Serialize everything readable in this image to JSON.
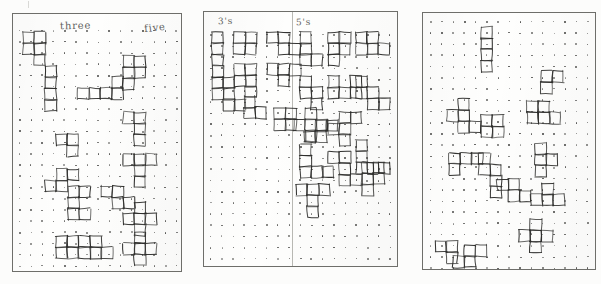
{
  "document": {
    "kind": "scanned-worksheet",
    "description": "Three sheets of dot-grid paper photographed side by side, each covered with hand-drawn polyomino shapes outlined on the dots.",
    "background_color": "#fcfcfb",
    "ink_color": "#2e2e2c",
    "dot_color": "#4a4a48",
    "border_color": "#6e6e6a"
  },
  "panels": [
    {
      "id": "panel-left",
      "name": "three-and-five-sheet",
      "labels": [
        {
          "text": "three",
          "x": 47,
          "y": 8
        },
        {
          "text": "five",
          "x": 131,
          "y": 10
        }
      ],
      "grid": {
        "cols": 15,
        "rows": 23,
        "spacing": 11.2,
        "offset_x": 6,
        "offset_y": 16
      },
      "divider_x": null,
      "shape_count": 14
    },
    {
      "id": "panel-middle",
      "name": "threes-and-fives-sheet",
      "labels": [
        {
          "text": "3's",
          "x": 14,
          "y": 5
        },
        {
          "text": "5's",
          "x": 92,
          "y": 6
        }
      ],
      "grid": {
        "cols": 17,
        "rows": 22,
        "spacing": 11.2,
        "offset_x": 6,
        "offset_y": 22
      },
      "divider_x": 88,
      "shape_count": 23
    },
    {
      "id": "panel-right",
      "name": "unlabelled-sheet",
      "labels": [],
      "grid": {
        "cols": 15,
        "rows": 23,
        "spacing": 11.2,
        "offset_x": 7,
        "offset_y": 8
      },
      "divider_x": null,
      "shape_count": 13
    }
  ],
  "shapes": {
    "panel-left": [
      {
        "name": "P-pentomino",
        "cells": [
          [
            0,
            0
          ],
          [
            1,
            0
          ],
          [
            0,
            1
          ],
          [
            1,
            1
          ],
          [
            1,
            2
          ]
        ],
        "x": 10,
        "y": 18
      },
      {
        "name": "I-tetromino",
        "cells": [
          [
            0,
            0
          ],
          [
            0,
            1
          ],
          [
            0,
            2
          ],
          [
            0,
            3
          ]
        ],
        "x": 32,
        "y": 52
      },
      {
        "name": "L-pentomino",
        "cells": [
          [
            0,
            0
          ],
          [
            1,
            0
          ],
          [
            2,
            0
          ],
          [
            3,
            0
          ],
          [
            3,
            -1
          ]
        ],
        "x": 65,
        "y": 74
      },
      {
        "name": "P-pentomino",
        "cells": [
          [
            0,
            0
          ],
          [
            1,
            0
          ],
          [
            0,
            1
          ],
          [
            1,
            1
          ],
          [
            0,
            2
          ]
        ],
        "x": 110,
        "y": 42
      },
      {
        "name": "T-tetromino",
        "cells": [
          [
            0,
            0
          ],
          [
            1,
            0
          ],
          [
            1,
            1
          ]
        ],
        "x": 43,
        "y": 120
      },
      {
        "name": "L-tetromino",
        "cells": [
          [
            0,
            0
          ],
          [
            1,
            0
          ],
          [
            1,
            1
          ],
          [
            1,
            2
          ]
        ],
        "x": 110,
        "y": 98
      },
      {
        "name": "S-pentomino",
        "cells": [
          [
            1,
            0
          ],
          [
            2,
            0
          ],
          [
            0,
            1
          ],
          [
            1,
            1
          ]
        ],
        "x": 32,
        "y": 155
      },
      {
        "name": "T-pentomino",
        "cells": [
          [
            0,
            0
          ],
          [
            1,
            0
          ],
          [
            2,
            0
          ],
          [
            1,
            1
          ],
          [
            1,
            2
          ]
        ],
        "x": 110,
        "y": 140
      },
      {
        "name": "Y-pentomino",
        "cells": [
          [
            0,
            0
          ],
          [
            1,
            0
          ],
          [
            0,
            1
          ],
          [
            0,
            2
          ],
          [
            1,
            2
          ]
        ],
        "x": 55,
        "y": 172
      },
      {
        "name": "Z-pentomino",
        "cells": [
          [
            0,
            0
          ],
          [
            1,
            0
          ],
          [
            1,
            1
          ],
          [
            2,
            1
          ]
        ],
        "x": 88,
        "y": 172
      },
      {
        "name": "X-pentomino",
        "cells": [
          [
            1,
            0
          ],
          [
            0,
            1
          ],
          [
            1,
            1
          ],
          [
            2,
            1
          ],
          [
            1,
            2
          ]
        ],
        "x": 110,
        "y": 188
      },
      {
        "name": "O-tetromino",
        "cells": [
          [
            0,
            0
          ],
          [
            1,
            0
          ],
          [
            0,
            1
          ],
          [
            1,
            1
          ]
        ],
        "x": 43,
        "y": 222
      },
      {
        "name": "P-pentomino",
        "cells": [
          [
            0,
            0
          ],
          [
            1,
            0
          ],
          [
            0,
            1
          ],
          [
            1,
            1
          ],
          [
            2,
            1
          ]
        ],
        "x": 66,
        "y": 222
      },
      {
        "name": "X-pentomino",
        "cells": [
          [
            1,
            0
          ],
          [
            0,
            1
          ],
          [
            1,
            1
          ],
          [
            2,
            1
          ],
          [
            1,
            2
          ]
        ],
        "x": 110,
        "y": 218
      }
    ],
    "panel-middle": [
      {
        "name": "I-tromino",
        "cells": [
          [
            0,
            0
          ],
          [
            0,
            1
          ],
          [
            0,
            2
          ]
        ],
        "x": 8,
        "y": 20
      },
      {
        "name": "O-square",
        "cells": [
          [
            0,
            0
          ],
          [
            1,
            0
          ],
          [
            0,
            1
          ],
          [
            1,
            1
          ]
        ],
        "x": 30,
        "y": 20
      },
      {
        "name": "S-piece",
        "cells": [
          [
            0,
            0
          ],
          [
            1,
            0
          ],
          [
            1,
            1
          ],
          [
            2,
            1
          ]
        ],
        "x": 63,
        "y": 20
      },
      {
        "name": "L-tromino",
        "cells": [
          [
            0,
            0
          ],
          [
            0,
            1
          ],
          [
            1,
            1
          ]
        ],
        "x": 8,
        "y": 54
      },
      {
        "name": "P-piece",
        "cells": [
          [
            0,
            0
          ],
          [
            1,
            0
          ],
          [
            0,
            1
          ],
          [
            1,
            1
          ],
          [
            1,
            2
          ]
        ],
        "x": 30,
        "y": 52
      },
      {
        "name": "T-piece",
        "cells": [
          [
            0,
            0
          ],
          [
            1,
            0
          ],
          [
            2,
            0
          ],
          [
            1,
            1
          ]
        ],
        "x": 63,
        "y": 52
      },
      {
        "name": "Z-piece",
        "cells": [
          [
            0,
            0
          ],
          [
            1,
            0
          ],
          [
            1,
            1
          ],
          [
            2,
            1
          ]
        ],
        "x": 8,
        "y": 76
      },
      {
        "name": "L-pentomino",
        "cells": [
          [
            0,
            0
          ],
          [
            0,
            1
          ],
          [
            0,
            2
          ],
          [
            1,
            2
          ]
        ],
        "x": 96,
        "y": 20
      },
      {
        "name": "T-pentomino",
        "cells": [
          [
            0,
            0
          ],
          [
            1,
            0
          ],
          [
            0,
            1
          ],
          [
            1,
            1
          ],
          [
            0,
            2
          ]
        ],
        "x": 124,
        "y": 20
      },
      {
        "name": "Y-pentomino",
        "cells": [
          [
            0,
            0
          ],
          [
            1,
            0
          ],
          [
            0,
            1
          ],
          [
            1,
            1
          ],
          [
            2,
            1
          ]
        ],
        "x": 152,
        "y": 20
      },
      {
        "name": "N-pentomino",
        "cells": [
          [
            0,
            0
          ],
          [
            0,
            1
          ],
          [
            1,
            1
          ],
          [
            1,
            2
          ]
        ],
        "x": 96,
        "y": 64
      },
      {
        "name": "U-pentomino",
        "cells": [
          [
            0,
            0
          ],
          [
            2,
            0
          ],
          [
            0,
            1
          ],
          [
            1,
            1
          ],
          [
            2,
            1
          ]
        ],
        "x": 124,
        "y": 64
      },
      {
        "name": "W-pentomino",
        "cells": [
          [
            0,
            0
          ],
          [
            0,
            1
          ],
          [
            1,
            1
          ],
          [
            1,
            2
          ],
          [
            2,
            2
          ]
        ],
        "x": 152,
        "y": 64
      },
      {
        "name": "X-pentomino",
        "cells": [
          [
            1,
            0
          ],
          [
            0,
            1
          ],
          [
            1,
            1
          ],
          [
            2,
            1
          ],
          [
            1,
            2
          ]
        ],
        "x": 90,
        "y": 96
      },
      {
        "name": "F-pentomino",
        "cells": [
          [
            1,
            0
          ],
          [
            2,
            0
          ],
          [
            0,
            1
          ],
          [
            1,
            1
          ],
          [
            1,
            2
          ]
        ],
        "x": 124,
        "y": 100
      },
      {
        "name": "V-pentomino",
        "cells": [
          [
            0,
            0
          ],
          [
            0,
            1
          ],
          [
            0,
            2
          ],
          [
            1,
            2
          ],
          [
            2,
            2
          ]
        ],
        "x": 96,
        "y": 132
      },
      {
        "name": "L-pentomino",
        "cells": [
          [
            0,
            0
          ],
          [
            0,
            1
          ],
          [
            0,
            2
          ],
          [
            1,
            2
          ],
          [
            2,
            2
          ]
        ],
        "x": 152,
        "y": 128
      },
      {
        "name": "Z-pentomino",
        "cells": [
          [
            0,
            0
          ],
          [
            1,
            0
          ],
          [
            1,
            1
          ],
          [
            1,
            2
          ],
          [
            2,
            2
          ]
        ],
        "x": 124,
        "y": 140
      },
      {
        "name": "T-pentomino",
        "cells": [
          [
            0,
            0
          ],
          [
            1,
            0
          ],
          [
            2,
            0
          ],
          [
            1,
            1
          ],
          [
            1,
            2
          ]
        ],
        "x": 92,
        "y": 172
      },
      {
        "name": "P-pentomino",
        "cells": [
          [
            0,
            0
          ],
          [
            1,
            0
          ],
          [
            0,
            1
          ],
          [
            1,
            1
          ],
          [
            0,
            2
          ]
        ],
        "x": 158,
        "y": 150
      },
      {
        "name": "S-pentomino",
        "cells": [
          [
            1,
            0
          ],
          [
            2,
            0
          ],
          [
            0,
            1
          ],
          [
            1,
            1
          ]
        ],
        "x": 100,
        "y": 108
      },
      {
        "name": "O-square",
        "cells": [
          [
            0,
            0
          ],
          [
            1,
            0
          ],
          [
            0,
            1
          ],
          [
            1,
            1
          ]
        ],
        "x": 70,
        "y": 96
      },
      {
        "name": "L-piece",
        "cells": [
          [
            0,
            0
          ],
          [
            0,
            1
          ],
          [
            1,
            1
          ]
        ],
        "x": 40,
        "y": 84
      }
    ],
    "panel-right": [
      {
        "name": "I-tetromino",
        "cells": [
          [
            0,
            0
          ],
          [
            0,
            1
          ],
          [
            0,
            2
          ],
          [
            0,
            3
          ]
        ],
        "x": 58,
        "y": 14
      },
      {
        "name": "F-pentomino",
        "cells": [
          [
            1,
            0
          ],
          [
            0,
            1
          ],
          [
            1,
            1
          ],
          [
            1,
            2
          ],
          [
            2,
            2
          ]
        ],
        "x": 24,
        "y": 86
      },
      {
        "name": "P-pentomino",
        "cells": [
          [
            0,
            0
          ],
          [
            1,
            0
          ],
          [
            0,
            1
          ],
          [
            1,
            1
          ]
        ],
        "x": 58,
        "y": 102
      },
      {
        "name": "P-pentomino",
        "cells": [
          [
            0,
            0
          ],
          [
            1,
            0
          ],
          [
            0,
            1
          ],
          [
            1,
            1
          ],
          [
            2,
            1
          ]
        ],
        "x": 104,
        "y": 88
      },
      {
        "name": "L-pentomino",
        "cells": [
          [
            0,
            0
          ],
          [
            1,
            0
          ],
          [
            2,
            0
          ],
          [
            0,
            1
          ]
        ],
        "x": 26,
        "y": 140
      },
      {
        "name": "N-pentomino",
        "cells": [
          [
            0,
            0
          ],
          [
            0,
            1
          ],
          [
            1,
            1
          ],
          [
            1,
            2
          ],
          [
            1,
            3
          ]
        ],
        "x": 56,
        "y": 140
      },
      {
        "name": "Y-pentomino",
        "cells": [
          [
            0,
            0
          ],
          [
            0,
            1
          ],
          [
            0,
            2
          ],
          [
            1,
            1
          ]
        ],
        "x": 112,
        "y": 130
      },
      {
        "name": "T-pentomino",
        "cells": [
          [
            1,
            0
          ],
          [
            0,
            1
          ],
          [
            1,
            1
          ],
          [
            2,
            1
          ]
        ],
        "x": 108,
        "y": 170
      },
      {
        "name": "Z-pentomino",
        "cells": [
          [
            0,
            0
          ],
          [
            1,
            0
          ],
          [
            1,
            1
          ],
          [
            2,
            1
          ]
        ],
        "x": 74,
        "y": 166
      },
      {
        "name": "X-pentomino",
        "cells": [
          [
            1,
            0
          ],
          [
            0,
            1
          ],
          [
            1,
            1
          ],
          [
            2,
            1
          ],
          [
            1,
            2
          ]
        ],
        "x": 96,
        "y": 206
      },
      {
        "name": "L-tetromino",
        "cells": [
          [
            0,
            0
          ],
          [
            1,
            0
          ],
          [
            1,
            1
          ]
        ],
        "x": 12,
        "y": 228
      },
      {
        "name": "S-pentomino",
        "cells": [
          [
            1,
            0
          ],
          [
            2,
            0
          ],
          [
            0,
            1
          ],
          [
            1,
            1
          ]
        ],
        "x": 30,
        "y": 232
      },
      {
        "name": "T-piece",
        "cells": [
          [
            0,
            0
          ],
          [
            1,
            0
          ],
          [
            0,
            1
          ]
        ],
        "x": 118,
        "y": 58
      }
    ]
  }
}
